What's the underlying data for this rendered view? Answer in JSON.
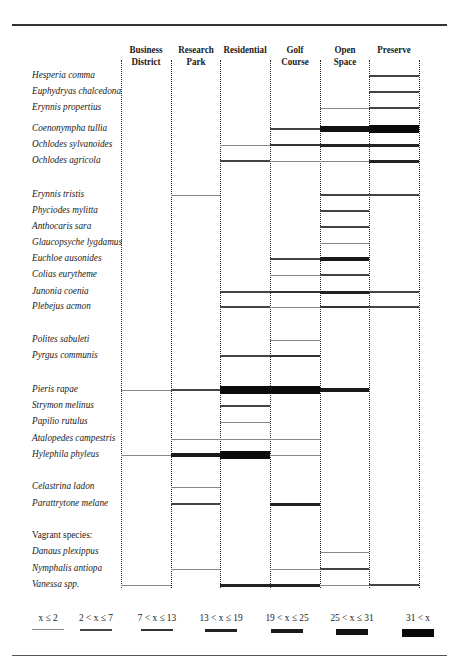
{
  "chart_data": {
    "type": "table",
    "title": "",
    "columns": [
      "Business District",
      "Research Park",
      "Residential",
      "Golf Course",
      "Open Space",
      "Preserve"
    ],
    "column_headers": [
      {
        "line1": "Business",
        "line2": "District"
      },
      {
        "line1": "Research",
        "line2": "Park"
      },
      {
        "line1": "Residential",
        "line2": ""
      },
      {
        "line1": "Golf Course",
        "line2": ""
      },
      {
        "line1": "Open Space",
        "line2": ""
      },
      {
        "line1": "Preserve",
        "line2": ""
      }
    ],
    "legend": [
      {
        "label": "x ≤ 2",
        "level": 1
      },
      {
        "label": "2 < x ≤ 7",
        "level": 2
      },
      {
        "label": "7 < x ≤ 13",
        "level": 3
      },
      {
        "label": "13 < x ≤ 19",
        "level": 4
      },
      {
        "label": "19 < x ≤ 25",
        "level": 5
      },
      {
        "label": "25 < x ≤ 31",
        "level": 6
      },
      {
        "label": "31 < x",
        "level": 7
      }
    ],
    "abundance_levels_note": "values per habitat: 0 = absent, 1..7 = legend category",
    "species": [
      {
        "name": "Hesperia comma",
        "y": 76,
        "values": [
          0,
          0,
          0,
          0,
          0,
          2
        ]
      },
      {
        "name": "Euphydryas chalcedona",
        "y": 92,
        "values": [
          0,
          0,
          0,
          0,
          0,
          2
        ]
      },
      {
        "name": "Erynnis propertius",
        "y": 108,
        "values": [
          0,
          0,
          0,
          0,
          1,
          2
        ]
      },
      {
        "name": "Coenonympha tullia",
        "y": 129,
        "values": [
          0,
          0,
          0,
          2,
          6,
          7
        ]
      },
      {
        "name": "Ochlodes sylvanoides",
        "y": 145,
        "values": [
          0,
          0,
          1,
          3,
          4,
          4
        ]
      },
      {
        "name": "Ochlodes agricola",
        "y": 161,
        "values": [
          0,
          0,
          2,
          1,
          1,
          4
        ]
      },
      {
        "name": "Erynnis tristis",
        "y": 195,
        "values": [
          0,
          1,
          0,
          0,
          2,
          2
        ]
      },
      {
        "name": "Phyciodes mylitta",
        "y": 211,
        "values": [
          0,
          0,
          0,
          0,
          2,
          0
        ]
      },
      {
        "name": "Anthocaris sara",
        "y": 227,
        "values": [
          0,
          0,
          0,
          0,
          2,
          0
        ]
      },
      {
        "name": "Glaucopsyche lygdamus",
        "y": 243,
        "values": [
          0,
          0,
          0,
          0,
          1,
          0
        ]
      },
      {
        "name": "Euchloe ausonides",
        "y": 259,
        "values": [
          0,
          0,
          0,
          2,
          5,
          0
        ]
      },
      {
        "name": "Colias eurytheme",
        "y": 275,
        "values": [
          0,
          0,
          0,
          1,
          2,
          0
        ]
      },
      {
        "name": "Junonia coenia",
        "y": 292,
        "values": [
          0,
          0,
          2,
          3,
          4,
          2
        ]
      },
      {
        "name": "Plebejus acmon",
        "y": 307,
        "values": [
          0,
          0,
          2,
          1,
          3,
          2
        ]
      },
      {
        "name": "Polites sabuleti",
        "y": 340,
        "values": [
          0,
          0,
          0,
          1,
          0,
          0
        ]
      },
      {
        "name": "Pyrgus communis",
        "y": 356,
        "values": [
          0,
          0,
          2,
          3,
          0,
          0
        ]
      },
      {
        "name": "Pieris rapae",
        "y": 390,
        "values": [
          1,
          2,
          7,
          7,
          5,
          0
        ]
      },
      {
        "name": "Strymon melinus",
        "y": 406,
        "values": [
          0,
          0,
          2,
          0,
          0,
          0
        ]
      },
      {
        "name": "Papilio rutulus",
        "y": 422,
        "values": [
          0,
          0,
          1,
          0,
          0,
          0
        ]
      },
      {
        "name": "Atalopedes campestris",
        "y": 439,
        "values": [
          0,
          1,
          1,
          1,
          0,
          0
        ]
      },
      {
        "name": "Hylephila phyleus",
        "y": 455,
        "values": [
          1,
          5,
          7,
          1,
          0,
          0
        ]
      },
      {
        "name": "Celastrina ladon",
        "y": 487,
        "values": [
          0,
          1,
          0,
          0,
          0,
          0
        ]
      },
      {
        "name": "Parattrytone melane",
        "y": 504,
        "values": [
          0,
          2,
          0,
          4,
          0,
          0
        ]
      },
      {
        "name": "Danaus plexippus",
        "y": 552,
        "values": [
          0,
          0,
          0,
          0,
          1,
          0
        ]
      },
      {
        "name": "Nymphalis antiopa",
        "y": 569,
        "values": [
          0,
          1,
          0,
          1,
          2,
          0
        ]
      },
      {
        "name": "Vanessa spp.",
        "y": 585,
        "values": [
          1,
          0,
          4,
          4,
          1,
          2
        ]
      }
    ],
    "section_headers": [
      {
        "text": "Vagrant species:",
        "y": 536
      }
    ]
  }
}
